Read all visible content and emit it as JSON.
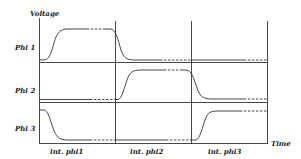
{
  "diagram": {
    "y_axis_label": "Voltage",
    "x_axis_label": "Time",
    "signals": [
      {
        "label": "Phi 1"
      },
      {
        "label": "Phi 2"
      },
      {
        "label": "Phi 3"
      }
    ],
    "intervals": [
      {
        "label": "int.  phi1"
      },
      {
        "label": "int.  phi2"
      },
      {
        "label": "int.  phi3"
      }
    ],
    "colors": {
      "line": "#333333",
      "background": "#ffffff"
    }
  }
}
